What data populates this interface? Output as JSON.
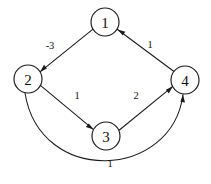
{
  "figure": {
    "kind": "directed-weighted-graph",
    "width": 211,
    "height": 184,
    "background_color": "#ffffff",
    "stroke_color": "#1a1a1a",
    "text_color": "#111111"
  },
  "graph_data": {
    "type": "diagram",
    "directed": true,
    "weighted": true,
    "node_radius": 14,
    "nodes": [
      {
        "id": "1",
        "label": "1",
        "cx": 105,
        "cy": 22
      },
      {
        "id": "2",
        "label": "2",
        "cx": 28,
        "cy": 79
      },
      {
        "id": "3",
        "label": "3",
        "cx": 106,
        "cy": 136
      },
      {
        "id": "4",
        "label": "4",
        "cx": 185,
        "cy": 80
      }
    ],
    "edges": [
      {
        "from": "1",
        "to": "2",
        "weight": "-3",
        "shape": "straight",
        "label_x": 50,
        "label_y": 45,
        "x1": 93.0,
        "y1": 29.1,
        "x2": 40.0,
        "y2": 71.9
      },
      {
        "from": "4",
        "to": "1",
        "weight": "1",
        "shape": "straight",
        "label_x": 150,
        "label_y": 44,
        "x1": 174.0,
        "y1": 71.5,
        "x2": 117.5,
        "y2": 29.5
      },
      {
        "from": "2",
        "to": "3",
        "weight": "1",
        "shape": "straight",
        "label_x": 77,
        "label_y": 95,
        "x1": 40.4,
        "y1": 85.4,
        "x2": 93.6,
        "y2": 129.6
      },
      {
        "from": "3",
        "to": "4",
        "weight": "2",
        "shape": "straight",
        "label_x": 136,
        "label_y": 95,
        "x1": 118.8,
        "y1": 130.5,
        "x2": 172.8,
        "y2": 86.3
      },
      {
        "from": "2",
        "to": "4",
        "weight": "1",
        "shape": "curved-below",
        "label_x": 110,
        "label_y": 163,
        "x1": 25.0,
        "y1": 93.0,
        "cx1": 40.0,
        "cy1": 186.0,
        "cx2": 172.0,
        "cy2": 180.0,
        "x2": 183.0,
        "y2": 94.5
      }
    ]
  }
}
